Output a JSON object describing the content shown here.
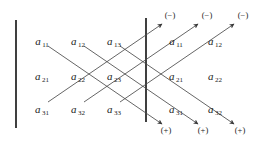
{
  "figure": {
    "ink_color": "#1a1a1a",
    "line_color": "#4a4a4a",
    "bar_color": "#2b2b2b"
  },
  "matrix": {
    "rows": [
      [
        {
          "base": "a",
          "sub": "11",
          "x": 42,
          "y": 40
        },
        {
          "base": "a",
          "sub": "12",
          "x": 78,
          "y": 40
        },
        {
          "base": "a",
          "sub": "13",
          "x": 114,
          "y": 40
        }
      ],
      [
        {
          "base": "a",
          "sub": "21",
          "x": 42,
          "y": 75
        },
        {
          "base": "a",
          "sub": "22",
          "x": 78,
          "y": 75
        },
        {
          "base": "a",
          "sub": "23",
          "x": 114,
          "y": 75
        }
      ],
      [
        {
          "base": "a",
          "sub": "31",
          "x": 42,
          "y": 108
        },
        {
          "base": "a",
          "sub": "32",
          "x": 78,
          "y": 108
        },
        {
          "base": "a",
          "sub": "33",
          "x": 114,
          "y": 108
        }
      ]
    ]
  },
  "repeated_columns": {
    "rows": [
      [
        {
          "base": "a",
          "sub": "11",
          "x": 176,
          "y": 40
        },
        {
          "base": "a",
          "sub": "12",
          "x": 215,
          "y": 40
        }
      ],
      [
        {
          "base": "a",
          "sub": "21",
          "x": 176,
          "y": 75
        },
        {
          "base": "a",
          "sub": "22",
          "x": 215,
          "y": 75
        }
      ],
      [
        {
          "base": "a",
          "sub": "31",
          "x": 176,
          "y": 108
        },
        {
          "base": "a",
          "sub": "32",
          "x": 215,
          "y": 108
        }
      ]
    ]
  },
  "signs": {
    "negative_label": "(−)",
    "positive_label": "(+)",
    "negative": [
      {
        "label": "(−)",
        "x": 170,
        "y": 15
      },
      {
        "label": "(−)",
        "x": 207,
        "y": 15
      },
      {
        "label": "(−)",
        "x": 243,
        "y": 15
      }
    ],
    "positive": [
      {
        "label": "(+)",
        "x": 166,
        "y": 130
      },
      {
        "label": "(+)",
        "x": 203,
        "y": 130
      },
      {
        "label": "(+)",
        "x": 240,
        "y": 130
      }
    ]
  },
  "bars": [
    {
      "name": "left-determinant-bar",
      "x": 16,
      "y1": 20,
      "y2": 128
    },
    {
      "name": "right-determinant-bar",
      "x": 146,
      "y1": 18,
      "y2": 122
    }
  ],
  "diagonals": {
    "down_right_positive": [
      {
        "x1": 48,
        "y1": 46,
        "x2": 162,
        "y2": 124
      },
      {
        "x1": 84,
        "y1": 46,
        "x2": 198,
        "y2": 124
      },
      {
        "x1": 120,
        "y1": 46,
        "x2": 234,
        "y2": 124
      }
    ],
    "up_right_negative": [
      {
        "x1": 48,
        "y1": 102,
        "x2": 162,
        "y2": 24
      },
      {
        "x1": 84,
        "y1": 102,
        "x2": 198,
        "y2": 24
      },
      {
        "x1": 120,
        "y1": 102,
        "x2": 234,
        "y2": 24
      }
    ]
  }
}
